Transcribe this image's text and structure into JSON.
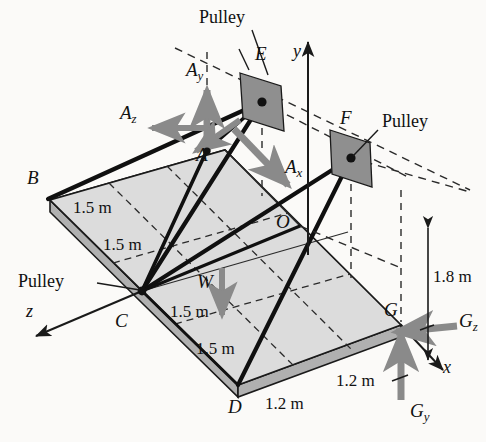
{
  "figure": {
    "colors": {
      "plate_top": "#dcdcdc",
      "plate_edge": "#b3b3b3",
      "pulley_fill": "#8f8f8f",
      "force_arrow": "#8a8a8a",
      "line": "#1a1a1a",
      "background": "#fbfaf8"
    }
  },
  "points": {
    "A": "A",
    "B": "B",
    "C": "C",
    "D": "D",
    "E": "E",
    "F": "F",
    "G": "G",
    "O": "O"
  },
  "axes": {
    "x": "x",
    "y": "y",
    "z": "z"
  },
  "forces": {
    "Ax_base": "A",
    "Ax_sub": "x",
    "Ay_base": "A",
    "Ay_sub": "y",
    "Az_base": "A",
    "Az_sub": "z",
    "Gy_base": "G",
    "Gy_sub": "y",
    "Gz_base": "G",
    "Gz_sub": "z",
    "W": "W"
  },
  "annotations": {
    "pulley_top": "Pulley",
    "pulley_right": "Pulley",
    "pulley_left": "Pulley"
  },
  "dimensions": {
    "b_edge_1": "1.5 m",
    "b_edge_2": "1.5 m",
    "c_edge_1": "1.5 m",
    "c_edge_2": "1.5 m",
    "bottom_1": "1.2 m",
    "bottom_2": "1.2 m",
    "height": "1.8 m"
  }
}
